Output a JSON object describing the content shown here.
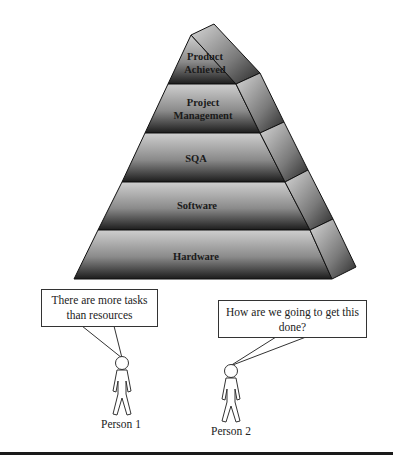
{
  "pyramid": {
    "tiers": [
      {
        "label_lines": [
          "Product",
          "Achieved"
        ]
      },
      {
        "label_lines": [
          "Project",
          "Management"
        ]
      },
      {
        "label_lines": [
          "SQA"
        ]
      },
      {
        "label_lines": [
          "Software"
        ]
      },
      {
        "label_lines": [
          "Hardware"
        ]
      }
    ],
    "colors": {
      "light": "#c8c8c8",
      "dark": "#1e1e1e",
      "edge": "#111111"
    }
  },
  "people": [
    {
      "label": "Person 1",
      "speech": "There are more tasks than resources"
    },
    {
      "label": "Person 2",
      "speech": "How are we going to get this done?"
    }
  ]
}
